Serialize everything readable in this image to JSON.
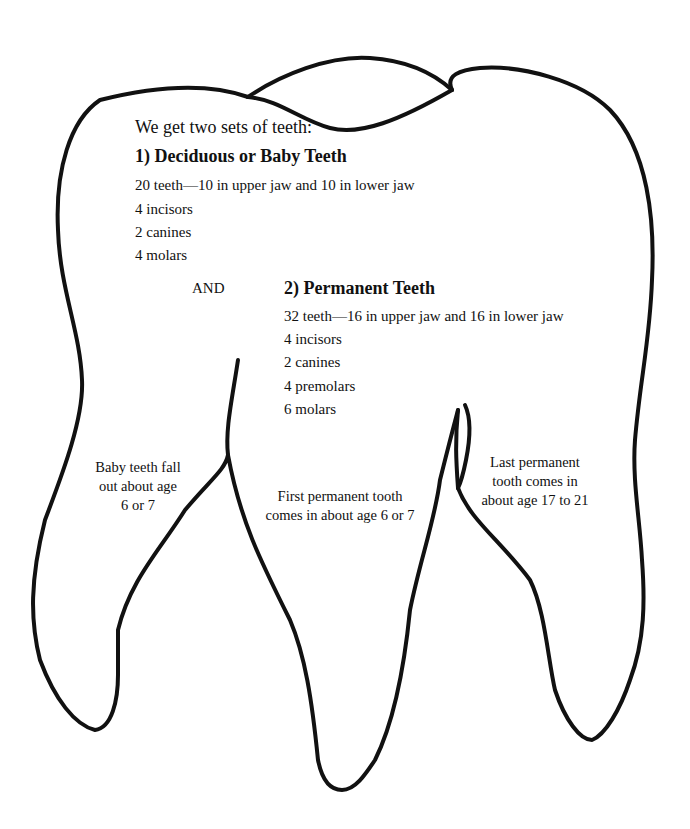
{
  "intro": "We get two sets of teeth:",
  "deciduous": {
    "heading": "1) Deciduous or Baby Teeth",
    "lines": [
      "20 teeth—10 in upper jaw and 10 in lower jaw",
      "4 incisors",
      "2 canines",
      "4 molars"
    ]
  },
  "connector": "AND",
  "permanent": {
    "heading": "2) Permanent Teeth",
    "lines": [
      "32 teeth—16 in upper jaw and 16 in lower jaw",
      "4 incisors",
      "2 canines",
      "4 premolars",
      "6 molars"
    ]
  },
  "roots": {
    "left": [
      "Baby teeth fall",
      "out about age",
      "6 or 7"
    ],
    "middle": [
      "First permanent tooth",
      "comes in about age 6 or 7"
    ],
    "right": [
      "Last permanent",
      "tooth comes in",
      "about age 17 to 21"
    ]
  },
  "colors": {
    "outline": "#111111",
    "background": "#ffffff"
  }
}
